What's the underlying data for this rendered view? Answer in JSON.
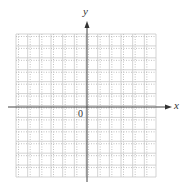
{
  "diagram": {
    "type": "coordinate-grid",
    "x_axis_label": "x",
    "y_axis_label": "y",
    "origin_label": "0",
    "columns": 12,
    "rows": 12,
    "origin_column": 6,
    "origin_row": 6,
    "colors": {
      "grid": "#c8c8c8",
      "grid_dots": "#b0b0b0",
      "axis": "#444444",
      "text": "#333333"
    }
  }
}
